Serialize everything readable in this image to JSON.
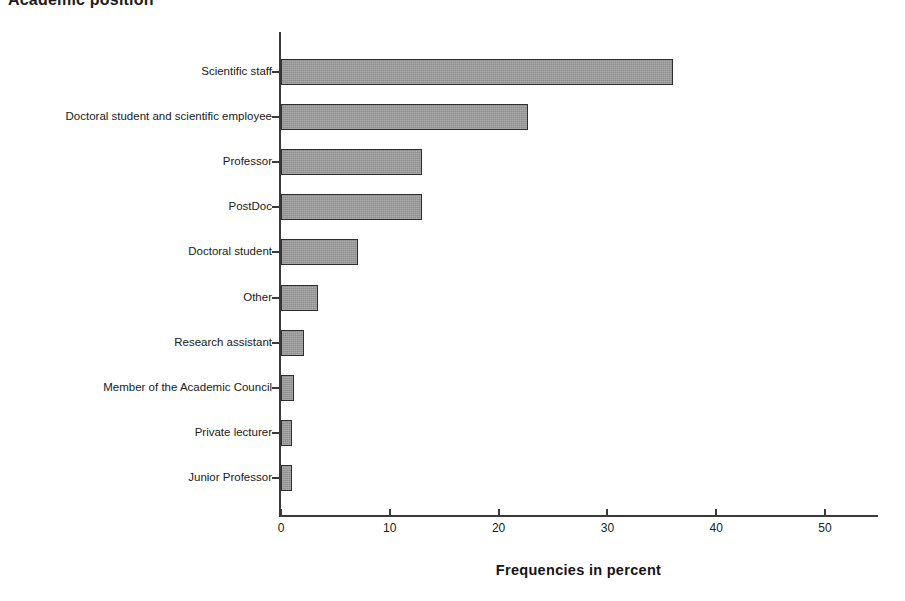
{
  "chart_data": {
    "type": "bar",
    "orientation": "horizontal",
    "title": "Academic position",
    "xlabel": "Frequencies in percent",
    "ylabel": "",
    "xlim": [
      0,
      55
    ],
    "xticks": [
      0,
      10,
      20,
      30,
      40,
      50
    ],
    "xtick_labels": [
      "0",
      "10",
      "20",
      "30",
      "40",
      "50"
    ],
    "grid": false,
    "legend": null,
    "bar_color": "#9a9a9a",
    "bar_edge_color": "#2e2e2e",
    "axis_color": "#3a3a3a",
    "categories": [
      "Junior Professor",
      "Private lecturer",
      "Member of the Academic Council",
      "Research assistant",
      "Other",
      "Doctoral student",
      "PostDoc",
      "Professor",
      "Doctoral student and scientific employee",
      "Scientific staff"
    ],
    "values": [
      1.0,
      1.0,
      1.2,
      2.1,
      3.4,
      7.1,
      13.0,
      13.0,
      22.7,
      36.0
    ]
  }
}
